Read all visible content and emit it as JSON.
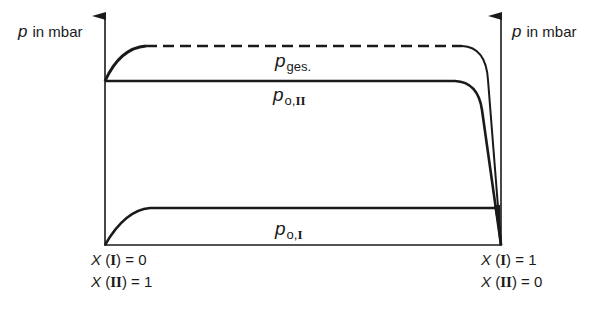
{
  "axes": {
    "left_label": {
      "symbol": "p",
      "unit": "in mbar"
    },
    "right_label": {
      "symbol": "p",
      "unit": "in mbar"
    }
  },
  "curves": {
    "total": {
      "symbol": "p",
      "subscript": "ges.",
      "style": "dashed"
    },
    "component_II": {
      "symbol": "p",
      "subscript_prefix": "o,",
      "subscript_roman": "II",
      "style": "solid"
    },
    "component_I": {
      "symbol": "p",
      "subscript_prefix": "o,",
      "subscript_roman": "I",
      "style": "solid"
    }
  },
  "x_labels": {
    "left": [
      {
        "var": "X",
        "comp": "I",
        "eq": " = 0"
      },
      {
        "var": "X",
        "comp": "II",
        "eq": " = 1"
      }
    ],
    "right": [
      {
        "var": "X",
        "comp": "I",
        "eq": " = 1"
      },
      {
        "var": "X",
        "comp": "II",
        "eq": " = 0"
      }
    ]
  }
}
